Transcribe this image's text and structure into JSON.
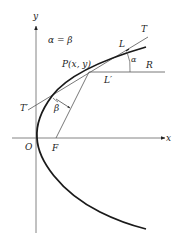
{
  "diagram": {
    "equation_label": "α = β",
    "axes": {
      "x_label": "x",
      "y_label": "y",
      "origin_label": "O"
    },
    "points": {
      "focus_label": "F",
      "point_label": "P(x, y)"
    },
    "lines": {
      "tangent_end_label": "T",
      "tangent_start_label": "T′",
      "incoming_ray_label": "L",
      "horizontal_ray_label": "L′",
      "horizontal_end_label": "R"
    },
    "angles": {
      "alpha_label": "α",
      "beta_label": "β"
    },
    "colors": {
      "curve": "#1a1a1a",
      "lines": "#555555",
      "text": "#222222"
    }
  }
}
